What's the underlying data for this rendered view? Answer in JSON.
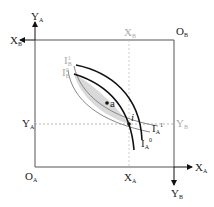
{
  "diagram": {
    "type": "edgeworth-box",
    "origins": {
      "A": {
        "label": "O",
        "sub": "A"
      },
      "B": {
        "label": "O",
        "sub": "B"
      }
    },
    "axes": {
      "YA": {
        "label": "Y",
        "sub": "A"
      },
      "XB": {
        "label": "X",
        "sub": "B"
      },
      "XA": {
        "label": "X",
        "sub": "A"
      },
      "YB": {
        "label": "Y",
        "sub": "B"
      }
    },
    "endowment": {
      "XA_tick": {
        "label": "X",
        "sub": "A"
      },
      "YA_tick": {
        "label": "Y",
        "sub": "A"
      },
      "XB_tick": {
        "label": "X",
        "sub": "B"
      },
      "YB_tick": {
        "label": "Y",
        "sub": "B"
      }
    },
    "points": {
      "i": {
        "label": "i"
      },
      "a": {
        "label": "a"
      }
    },
    "curves": {
      "IB0": {
        "label": "I",
        "sub": "B",
        "sup": "0"
      },
      "IB1": {
        "label": "I",
        "sub": "B",
        "sup": "1"
      },
      "IA1": {
        "label": "I",
        "sub": "A",
        "sup": "1"
      },
      "IA0": {
        "label": "I",
        "sub": "A",
        "sup": "0"
      }
    },
    "colors": {
      "frame": "#555555",
      "curve_dark": "#111111",
      "curve_grey": "#888888",
      "lens_fill": "#d9d9d9",
      "dashed": "#999999"
    }
  }
}
